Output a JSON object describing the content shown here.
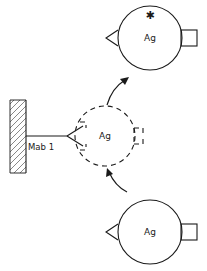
{
  "figure": {
    "type": "immunoassay-schematic"
  },
  "wall": {
    "label": "",
    "hatch_color": "#555555"
  },
  "antibody": {
    "name": "Mab 1",
    "label": "Mab 1"
  },
  "complexes": {
    "top": {
      "label": "Ag",
      "marker": "asterisk-icon",
      "marker_glyph": "✱",
      "left_epitope": "triangle",
      "right_epitope": "square",
      "state": "bound-labeled"
    },
    "middle": {
      "label": "Ag",
      "marker": "",
      "left_epitope": "triangle",
      "right_epitope": "square",
      "state": "transition-dashed"
    },
    "bottom": {
      "label": "Ag",
      "marker": "",
      "left_epitope": "triangle",
      "right_epitope": "square",
      "state": "free"
    }
  },
  "arrows": {
    "upper": {
      "name": "arrow-to-top-complex",
      "direction": "up-right"
    },
    "lower": {
      "name": "arrow-from-bottom-complex",
      "direction": "up-left"
    }
  },
  "colors": {
    "ink": "#1a1a1a",
    "hatch": "#555555",
    "background": "#ffffff"
  }
}
